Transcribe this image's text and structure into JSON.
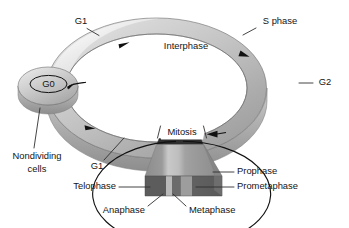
{
  "figure": {
    "type": "diagram"
  },
  "cycle": {
    "interphase_label": "Interphase",
    "mitosis_label": "Mitosis",
    "g0_label": "G0"
  },
  "labels": {
    "g1_top": "G1",
    "s_phase": "S phase",
    "g2": "G2",
    "g1_bottom": "G1",
    "nondividing_line1": "Nondividing",
    "nondividing_line2": "cells",
    "prophase": "Prophase",
    "prometaphase": "Prometaphase",
    "telophase": "Telophase",
    "anaphase": "Anaphase",
    "metaphase": "Metaphase"
  },
  "colors": {
    "ring_light": "#e3e3e3",
    "ring_mid": "#bdbdbd",
    "ring_dark": "#9a9a9a",
    "ring_shadow": "#8a8a8a",
    "block_dark": "#5e5e5e",
    "block_mid": "#8f8f8f",
    "block_light": "#b6b6b6",
    "block_top": "#3a3a3a",
    "stroke": "#6f6f6f",
    "text": "#141414",
    "background": "#ffffff"
  },
  "icons": {
    "cycle_arrow": "arrowhead-icon",
    "leader_line": "leader-line-icon"
  }
}
